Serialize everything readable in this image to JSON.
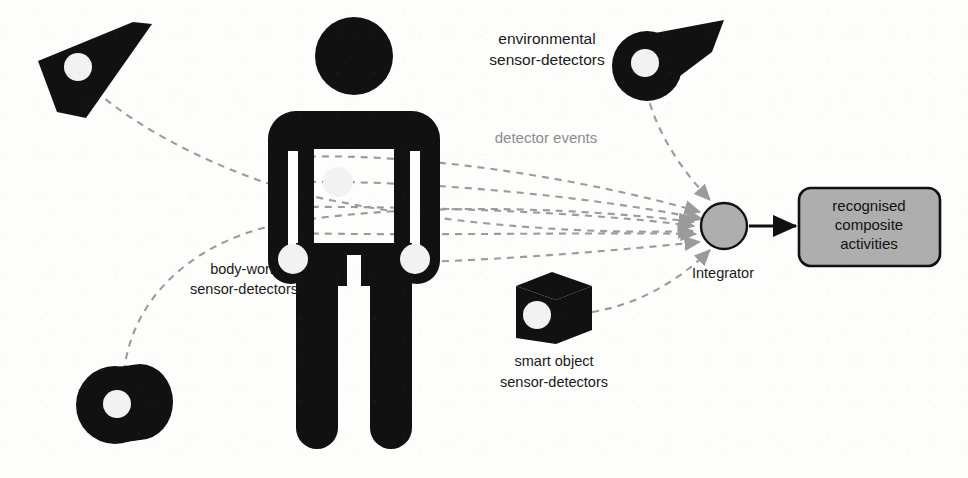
{
  "diagram": {
    "background_color": "#fdfdfc",
    "ink_color": "#111111",
    "dash_color": "#9b9b9b",
    "accent_gray": "#aeaeae",
    "labels": {
      "environmental": "environmental\nsensor-detectors",
      "environmental_line1": "environmental",
      "environmental_line2": "sensor-detectors",
      "detector_events": "detector events",
      "body_worn_line1": "body-worn",
      "body_worn_line2": "sensor-detectors",
      "smart_object_line1": "smart object",
      "smart_object_line2": "sensor-detectors",
      "integrator": "Integrator",
      "output_line1": "recognised",
      "output_line2": "composite",
      "output_line3": "activities"
    },
    "nodes": [
      {
        "id": "env-detector-left",
        "name": "environmental sensor-detector (upper left)",
        "shape": "wedge-polygon",
        "x": 95,
        "y": 65
      },
      {
        "id": "env-detector-right",
        "name": "environmental sensor-detector (upper right)",
        "shape": "disc-with-cone",
        "x": 648,
        "y": 65
      },
      {
        "id": "env-detector-bottom",
        "name": "environmental sensor-detector (lower left)",
        "shape": "stacked-disc",
        "x": 122,
        "y": 404
      },
      {
        "id": "smart-object",
        "name": "smart object sensor-detector",
        "shape": "cube",
        "x": 551,
        "y": 313
      },
      {
        "id": "integrator",
        "name": "Integrator",
        "shape": "circle",
        "x": 724,
        "y": 226
      },
      {
        "id": "output-box",
        "name": "recognised composite activities",
        "shape": "rounded-rect",
        "x": 869,
        "y": 226
      }
    ],
    "body_worn_sensors": [
      {
        "id": "chest",
        "x": 338,
        "y": 182
      },
      {
        "id": "left-wrist",
        "x": 296,
        "y": 258
      },
      {
        "id": "right-wrist",
        "x": 411,
        "y": 258
      }
    ],
    "edges": [
      {
        "from": "env-detector-left",
        "to": "integrator",
        "style": "dashed",
        "arrow": true
      },
      {
        "from": "env-detector-right",
        "to": "integrator",
        "style": "dashed",
        "arrow": true
      },
      {
        "from": "env-detector-bottom",
        "to": "integrator",
        "style": "dashed",
        "arrow": true
      },
      {
        "from": "smart-object",
        "to": "integrator",
        "style": "dashed",
        "arrow": true
      },
      {
        "from": "body-worn-sensors",
        "to": "integrator",
        "style": "dashed",
        "arrow": true
      },
      {
        "from": "integrator",
        "to": "output-box",
        "style": "solid",
        "arrow": true
      }
    ]
  }
}
